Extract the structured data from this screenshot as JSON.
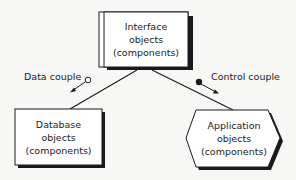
{
  "diagram": {
    "nodes": {
      "interface": {
        "line1": "Interface",
        "line2": "objects",
        "line3": "(components)"
      },
      "database": {
        "line1": "Database",
        "line2": "objects",
        "line3": "(components)"
      },
      "application": {
        "line1": "Application",
        "line2": "objects",
        "line3": "(components)"
      }
    },
    "couples": {
      "data": {
        "label": "Data couple",
        "symbol": "open-circle"
      },
      "control": {
        "label": "Control couple",
        "symbol": "filled-circle"
      }
    },
    "colors": {
      "stroke": "#1a1a1a",
      "fill": "#ffffff",
      "background": "#f7f7f5"
    }
  }
}
